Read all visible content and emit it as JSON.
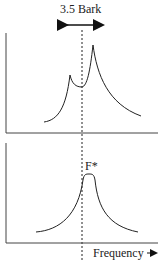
{
  "diagram": {
    "bandwidth_label": "3.5 Bark",
    "peak_label": "F*",
    "xaxis_label": "Frequency",
    "top_panel": "Two-peak spectrum with peaks within 3.5 Bark",
    "bottom_panel": "Single merged peak at center of gravity F*",
    "line_color": "#333333"
  }
}
